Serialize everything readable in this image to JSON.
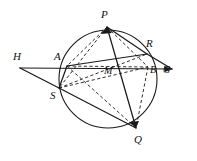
{
  "figure": {
    "type": "euclidean-circle-diagram",
    "title": "",
    "background": "#ffffff",
    "stroke_color": "#1a1a1a",
    "canvas": {
      "width": 197,
      "height": 161
    },
    "circle": {
      "cx": 108,
      "cy": 79,
      "r": 49
    },
    "points": [
      {
        "id": "P",
        "label": "P",
        "x": 107,
        "y": 27,
        "label_x": 101,
        "label_y": 9,
        "on_circle": true
      },
      {
        "id": "R",
        "label": "R",
        "x": 147,
        "y": 54,
        "label_x": 146,
        "label_y": 38,
        "on_circle": true
      },
      {
        "id": "B",
        "label": "B",
        "x": 148,
        "y": 67,
        "label_x": 150,
        "label_y": 65,
        "on_circle": true
      },
      {
        "id": "A",
        "label": "A",
        "x": 67,
        "y": 66,
        "label_x": 54,
        "label_y": 51,
        "on_circle": true
      },
      {
        "id": "S",
        "label": "S",
        "x": 59,
        "y": 88,
        "label_x": 50,
        "label_y": 90,
        "on_circle": true
      },
      {
        "id": "Q",
        "label": "Q",
        "x": 136,
        "y": 128,
        "label_x": 134,
        "label_y": 134,
        "on_circle": true
      },
      {
        "id": "M",
        "label": "M",
        "x": 107,
        "y": 70,
        "label_x": 104,
        "label_y": 66,
        "on_circle": false
      },
      {
        "id": "H",
        "label": "H",
        "x": 20,
        "y": 68,
        "label_x": 13,
        "label_y": 51,
        "on_circle": false
      },
      {
        "id": "G",
        "label": "G",
        "x": 172,
        "y": 69,
        "label_x": 163,
        "label_y": 65,
        "on_circle": false
      }
    ],
    "solid_segments": [
      {
        "name": "secant-H-to-G",
        "from": "H",
        "to": "G"
      },
      {
        "name": "H-to-S",
        "from": "H",
        "to": "S"
      },
      {
        "name": "S-to-Q",
        "from": "S",
        "to": "Q"
      },
      {
        "name": "P-to-Q",
        "from": "P",
        "to": "Q"
      },
      {
        "name": "P-to-R",
        "from": "P",
        "to": "R"
      },
      {
        "name": "R-to-G",
        "from": "R",
        "to": "G"
      },
      {
        "name": "A-to-R",
        "from": "A",
        "to": "R"
      },
      {
        "name": "S-to-A",
        "from": "S",
        "to": "A"
      }
    ],
    "dashed_segments": [
      {
        "name": "P-to-A",
        "from": "P",
        "to": "A"
      },
      {
        "name": "P-to-S",
        "from": "P",
        "to": "S"
      },
      {
        "name": "P-to-B",
        "from": "P",
        "to": "B"
      },
      {
        "name": "A-to-Q",
        "from": "A",
        "to": "Q"
      },
      {
        "name": "S-to-B",
        "from": "S",
        "to": "B"
      },
      {
        "name": "S-to-R",
        "from": "S",
        "to": "R"
      },
      {
        "name": "B-to-Q",
        "from": "B",
        "to": "Q"
      },
      {
        "name": "A-to-B",
        "from": "A",
        "to": "B"
      }
    ],
    "arrowheads": [
      {
        "name": "arrow-at-P",
        "at": "P"
      },
      {
        "name": "arrow-at-Q",
        "at": "Q"
      },
      {
        "name": "arrow-at-G",
        "at": "G"
      }
    ]
  }
}
